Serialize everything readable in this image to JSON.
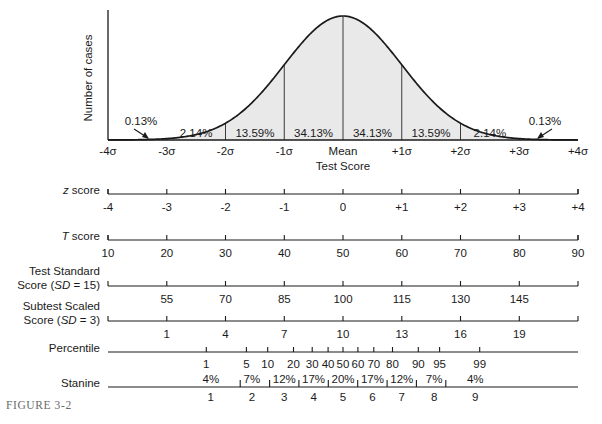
{
  "figure": {
    "caption": "FIGURE 3-2",
    "y_axis_label": "Number of cases",
    "x_axis_label": "Test Score"
  },
  "chart_data": {
    "type": "area",
    "title": "",
    "xlabel": "Test Score",
    "ylabel": "Number of cases",
    "xlim": [
      -4,
      4
    ],
    "grid": false,
    "legend": "none",
    "curve": "standard normal distribution",
    "fill_color": "#e9e9e9",
    "line_color": "#1a1a1a",
    "sigma_ticks": [
      "-4σ",
      "-3σ",
      "-2σ",
      "-1σ",
      "Mean",
      "+1σ",
      "+2σ",
      "+3σ",
      "+4σ"
    ],
    "sigma_positions": [
      -4,
      -3,
      -2,
      -1,
      0,
      1,
      2,
      3,
      4
    ],
    "band_percentages": [
      {
        "label": "0.13%",
        "from": -4,
        "to": -3,
        "callout": true
      },
      {
        "label": "2.14%",
        "from": -3,
        "to": -2,
        "callout": false
      },
      {
        "label": "13.59%",
        "from": -2,
        "to": -1,
        "callout": false
      },
      {
        "label": "34.13%",
        "from": -1,
        "to": 0,
        "callout": false
      },
      {
        "label": "34.13%",
        "from": 0,
        "to": 1,
        "callout": false
      },
      {
        "label": "13.59%",
        "from": 1,
        "to": 2,
        "callout": false
      },
      {
        "label": "2.14%",
        "from": 2,
        "to": 3,
        "callout": false
      },
      {
        "label": "0.13%",
        "from": 3,
        "to": 4,
        "callout": true
      }
    ],
    "scales": [
      {
        "id": "z-score",
        "label_html": "z score",
        "label_plain": "z score",
        "italic_part": "z",
        "rest_part": " score",
        "values": [
          "-4",
          "-3",
          "-2",
          "-1",
          "0",
          "+1",
          "+2",
          "+3",
          "+4"
        ],
        "positions": [
          -4,
          -3,
          -2,
          -1,
          0,
          1,
          2,
          3,
          4
        ]
      },
      {
        "id": "t-score",
        "label_html": "T score",
        "label_plain": "T score",
        "italic_part": "T",
        "rest_part": " score",
        "values": [
          "10",
          "20",
          "30",
          "40",
          "50",
          "60",
          "70",
          "80",
          "90"
        ],
        "positions": [
          -4,
          -3,
          -2,
          -1,
          0,
          1,
          2,
          3,
          4
        ]
      },
      {
        "id": "test-standard-score",
        "label_line1": "Test Standard",
        "label_line2_pre": "Score (",
        "label_line2_italic": "SD",
        "label_line2_post": " = 15)",
        "label_plain": "Test Standard Score (SD = 15)",
        "values": [
          "55",
          "70",
          "85",
          "100",
          "115",
          "130",
          "145"
        ],
        "positions": [
          -3,
          -2,
          -1,
          0,
          1,
          2,
          3
        ]
      },
      {
        "id": "subtest-scaled-score",
        "label_line1": "Subtest Scaled",
        "label_line2_pre": "Score (",
        "label_line2_italic": "SD",
        "label_line2_post": " = 3)",
        "label_plain": "Subtest Scaled Score (SD = 3)",
        "values": [
          "1",
          "4",
          "7",
          "10",
          "13",
          "16",
          "19"
        ],
        "positions": [
          -3,
          -2,
          -1,
          0,
          1,
          2,
          3
        ]
      },
      {
        "id": "percentile",
        "label_plain": "Percentile",
        "values": [
          "1",
          "5",
          "10",
          "20",
          "30",
          "40",
          "50",
          "60",
          "70",
          "80",
          "90",
          "95",
          "99"
        ],
        "positions": [
          -2.326,
          -1.645,
          -1.282,
          -0.842,
          -0.524,
          -0.253,
          0,
          0.253,
          0.524,
          0.842,
          1.282,
          1.645,
          2.326
        ]
      },
      {
        "id": "stanine",
        "label_plain": "Stanine",
        "values": [
          "1",
          "2",
          "3",
          "4",
          "5",
          "6",
          "7",
          "8",
          "9"
        ],
        "positions": [
          -2.25,
          -1.55,
          -1.0,
          -0.5,
          0,
          0.5,
          1.0,
          1.55,
          2.25
        ],
        "percentages": [
          "4%",
          "7%",
          "12%",
          "17%",
          "20%",
          "17%",
          "12%",
          "7%",
          "4%"
        ],
        "boundaries": [
          -1.75,
          -1.25,
          -0.75,
          -0.25,
          0.25,
          0.75,
          1.25,
          1.75
        ]
      }
    ]
  }
}
